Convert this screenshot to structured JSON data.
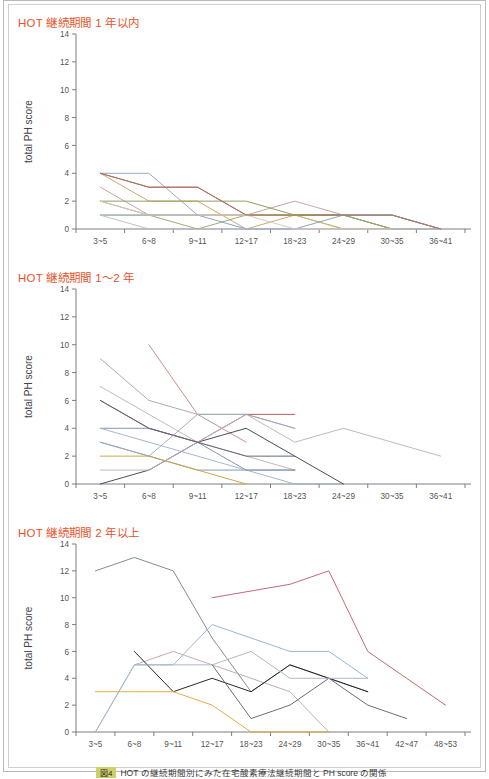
{
  "page": {
    "caption_badge": "図4",
    "caption_text": "HOT の継続期間別にみた在宅酸素療法継続期間と PH score の関係"
  },
  "axis": {
    "ylabel": "total PH score",
    "yticks": [
      0,
      2,
      4,
      6,
      8,
      10,
      12,
      14
    ],
    "ylim": [
      0,
      14
    ],
    "x_unit_label": "（カ月）"
  },
  "chart_data": [
    {
      "type": "line",
      "title": "HOT 継続期間 1 年以内",
      "xlabel": "（カ月）",
      "ylabel": "total PH score",
      "ylim": [
        0,
        14
      ],
      "yticks": [
        0,
        2,
        4,
        6,
        8,
        10,
        12,
        14
      ],
      "grid": false,
      "legend": "none",
      "categories": [
        "3~5",
        "6~8",
        "9~11",
        "12~17",
        "18~23",
        "24~29",
        "30~35",
        "36~41"
      ],
      "series": [
        {
          "name": "p1",
          "color": "#8fa8c8",
          "values": [
            4,
            4,
            1,
            1,
            1,
            1,
            0,
            null
          ]
        },
        {
          "name": "p2",
          "color": "#b5545a",
          "values": [
            4,
            3,
            3,
            1,
            1,
            1,
            1,
            0
          ]
        },
        {
          "name": "p3",
          "color": "#c9a36a",
          "values": [
            4,
            2,
            2,
            0,
            1,
            0,
            0,
            null
          ]
        },
        {
          "name": "p4",
          "color": "#c4a0a8",
          "values": [
            3,
            1,
            1,
            1,
            2,
            1,
            1,
            0
          ]
        },
        {
          "name": "p5",
          "color": "#8a9a55",
          "values": [
            2,
            2,
            2,
            2,
            1,
            1,
            0,
            null
          ]
        },
        {
          "name": "p6",
          "color": "#9aa86a",
          "values": [
            2,
            1,
            0,
            1,
            1,
            1,
            0,
            0
          ]
        },
        {
          "name": "p7",
          "color": "#c7b76a",
          "values": [
            1,
            1,
            1,
            1,
            1,
            0,
            0,
            null
          ]
        },
        {
          "name": "p8",
          "color": "#7fa2bf",
          "values": [
            1,
            1,
            1,
            0,
            0,
            1,
            1,
            0
          ]
        },
        {
          "name": "p9",
          "color": "#b8bcd0",
          "values": [
            1,
            0,
            0,
            0,
            0,
            0,
            0,
            0
          ]
        },
        {
          "name": "p10",
          "color": "#d6c6c0",
          "values": [
            2,
            1,
            1,
            1,
            0,
            0,
            0,
            null
          ]
        },
        {
          "name": "p11",
          "color": "#a5765f",
          "values": [
            4,
            3,
            3,
            1,
            1,
            1,
            1,
            0
          ]
        }
      ]
    },
    {
      "type": "line",
      "title": "HOT 継続期間 1～2 年",
      "xlabel": "（カ月）",
      "ylabel": "total PH score",
      "ylim": [
        0,
        14
      ],
      "yticks": [
        0,
        2,
        4,
        6,
        8,
        10,
        12,
        14
      ],
      "grid": false,
      "legend": "none",
      "categories": [
        "3~5",
        "6~8",
        "9~11",
        "12~17",
        "18~23",
        "24~29",
        "30~35",
        "36~41"
      ],
      "series": [
        {
          "name": "p1",
          "color": "#b0a4a8",
          "values": [
            9,
            6,
            5,
            5,
            4,
            null,
            null,
            null
          ]
        },
        {
          "name": "p2",
          "color": "#c08a8a",
          "values": [
            null,
            10,
            5,
            3,
            null,
            null,
            null,
            null
          ]
        },
        {
          "name": "p3",
          "color": "#c6b2b2",
          "values": [
            7,
            5,
            3,
            2,
            1,
            null,
            null,
            null
          ]
        },
        {
          "name": "p4",
          "color": "#b5545a",
          "values": [
            6,
            4,
            3,
            5,
            5,
            null,
            null,
            null
          ]
        },
        {
          "name": "p5",
          "color": "#7e8fa8",
          "values": [
            4,
            4,
            3,
            1,
            1,
            null,
            null,
            null
          ]
        },
        {
          "name": "p6",
          "color": "#9fb3cc",
          "values": [
            4,
            3,
            2,
            1,
            0,
            0,
            null,
            null
          ]
        },
        {
          "name": "p7",
          "color": "#7f96b5",
          "values": [
            3,
            2,
            1,
            1,
            1,
            null,
            null,
            null
          ]
        },
        {
          "name": "p8",
          "color": "#3c4454",
          "values": [
            0,
            1,
            3,
            4,
            2,
            0,
            null,
            null
          ]
        },
        {
          "name": "p9",
          "color": "#c7a33f",
          "values": [
            2,
            2,
            1,
            0,
            null,
            null,
            null,
            null
          ]
        },
        {
          "name": "p10",
          "color": "#c4b0b8",
          "values": [
            1,
            1,
            3,
            5,
            3,
            4,
            3,
            2
          ]
        },
        {
          "name": "p11",
          "color": "#5a6472",
          "values": [
            6,
            4,
            3,
            2,
            2,
            null,
            null,
            null
          ]
        },
        {
          "name": "p12",
          "color": "#9fa9bb",
          "values": [
            3,
            2,
            5,
            5,
            4,
            null,
            null,
            null
          ]
        }
      ]
    },
    {
      "type": "line",
      "title": "HOT 継続期間 2 年以上",
      "xlabel": "（カ月）",
      "ylabel": "total PH score",
      "ylim": [
        0,
        14
      ],
      "yticks": [
        0,
        2,
        4,
        6,
        8,
        10,
        12,
        14
      ],
      "grid": false,
      "legend": "none",
      "categories": [
        "3~5",
        "6~8",
        "9~11",
        "12~17",
        "18~23",
        "24~29",
        "30~35",
        "36~41",
        "42~47",
        "48~53"
      ],
      "series": [
        {
          "name": "p1",
          "color": "#7a8696",
          "values": [
            12,
            13,
            12,
            7,
            3,
            5,
            4,
            3,
            null,
            null
          ]
        },
        {
          "name": "p2",
          "color": "#c0606a",
          "values": [
            null,
            null,
            null,
            10,
            10.5,
            11,
            12,
            6,
            4,
            2
          ]
        },
        {
          "name": "p3",
          "color": "#93b4cc",
          "values": [
            0,
            5,
            5,
            8,
            7,
            6,
            6,
            4,
            null,
            null
          ]
        },
        {
          "name": "p4",
          "color": "#c4a8a8",
          "values": [
            null,
            5,
            6,
            5,
            4,
            3,
            0,
            null,
            null,
            null
          ]
        },
        {
          "name": "p5",
          "color": "#1d1d1d",
          "values": [
            null,
            6,
            3,
            4,
            3,
            5,
            4,
            3,
            null,
            null
          ]
        },
        {
          "name": "p6",
          "color": "#5e6672",
          "values": [
            null,
            null,
            null,
            5,
            1,
            2,
            4,
            2,
            1,
            null
          ]
        },
        {
          "name": "p7",
          "color": "#e3a93a",
          "values": [
            3,
            3,
            3,
            2,
            0,
            0,
            0,
            null,
            null,
            null
          ]
        },
        {
          "name": "p8",
          "color": "#aab6c4",
          "values": [
            0,
            5,
            5,
            5,
            6,
            4,
            4,
            4,
            null,
            null
          ]
        }
      ]
    }
  ]
}
